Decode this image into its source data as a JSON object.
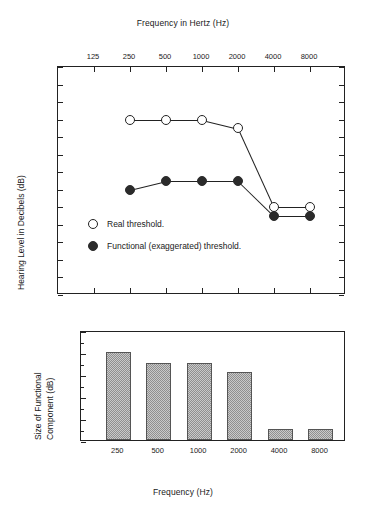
{
  "chart_data": [
    {
      "type": "line",
      "id": "audiogram",
      "title": "Frequency in Hertz (Hz)",
      "xlabel": "Frequency in Hertz (Hz)",
      "ylabel": "Hearing Level in Decibels (dB)",
      "x_axis_position": "top",
      "y_axis_inverted": true,
      "grid": false,
      "xticks": [
        125,
        250,
        500,
        1000,
        2000,
        4000,
        8000
      ],
      "xtick_labels": [
        "125",
        "250",
        "500",
        "1000",
        "2000",
        "4000",
        "8000"
      ],
      "yticks": [
        -10,
        0,
        10,
        20,
        30,
        40,
        50,
        60,
        70,
        80,
        90,
        100,
        110,
        120
      ],
      "ytick_labels": [
        "-10",
        "0",
        "10",
        "20",
        "30",
        "40",
        "50",
        "60",
        "70",
        "80",
        "90",
        "100",
        "110",
        "120"
      ],
      "ylim": [
        -10,
        120
      ],
      "legend_position": "inside-lower-left",
      "series": [
        {
          "name": "Real threshold.",
          "marker": "open-circle",
          "x": [
            250,
            500,
            1000,
            2000,
            4000,
            8000
          ],
          "values": [
            20,
            20,
            20,
            25,
            70,
            70
          ]
        },
        {
          "name": "Functional (exaggerated) threshold.",
          "marker": "filled-circle",
          "x": [
            250,
            500,
            1000,
            2000,
            4000,
            8000
          ],
          "values": [
            60,
            55,
            55,
            55,
            75,
            75
          ]
        }
      ]
    },
    {
      "type": "bar",
      "id": "functional-component",
      "title": "",
      "xlabel": "Frequency (Hz)",
      "ylabel": "Size of Functional Component (dB)",
      "ylabel_line1": "Size of Functional",
      "ylabel_line2": "Component (dB)",
      "grid": false,
      "categories": [
        "250",
        "500",
        "1000",
        "2000",
        "4000",
        "8000"
      ],
      "values": [
        40,
        35,
        35,
        31,
        5,
        5
      ],
      "ylim": [
        0,
        50
      ],
      "yticks": [
        0,
        10,
        20,
        30,
        40,
        50
      ],
      "ytick_labels": [
        "0",
        "10",
        "20",
        "30",
        "40",
        "50"
      ],
      "minor_tick_step": 5,
      "bar_fill": "#c9c9c9",
      "bar_edge": "#555555"
    }
  ],
  "colors": {
    "axis": "#222222",
    "marker_open_fill": "#ffffff",
    "marker_filled": "#2b2b2b",
    "background": "#ffffff"
  }
}
